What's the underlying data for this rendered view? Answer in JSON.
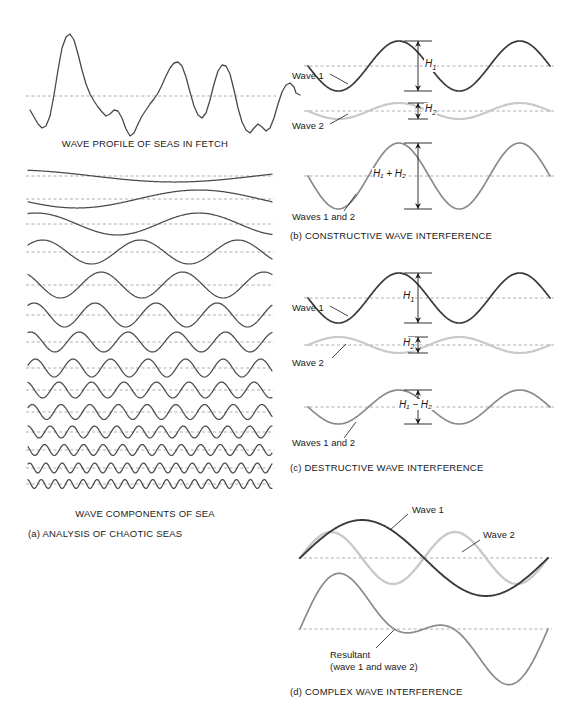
{
  "figure": {
    "background": "#ffffff",
    "colors": {
      "wave1": "#3a3a3a",
      "wave2": "#c9c9c9",
      "resultant": "#8a8a8a",
      "baseline": "#9a9a9a",
      "text": "#1a1a1a",
      "profile": "#4a4a4a"
    }
  },
  "panel_a": {
    "id": "a",
    "profile_caption": "WAVE PROFILE OF SEAS IN FETCH",
    "components_caption": "WAVE COMPONENTS OF SEA",
    "panel_caption": "(a) ANALYSIS OF CHAOTIC SEAS",
    "profile": {
      "baseline_y": 96,
      "points": [
        [
          30,
          110
        ],
        [
          34,
          117
        ],
        [
          38,
          124
        ],
        [
          42,
          128
        ],
        [
          46,
          126
        ],
        [
          50,
          116
        ],
        [
          54,
          95
        ],
        [
          58,
          70
        ],
        [
          62,
          48
        ],
        [
          66,
          37
        ],
        [
          70,
          34
        ],
        [
          74,
          40
        ],
        [
          78,
          54
        ],
        [
          82,
          70
        ],
        [
          86,
          84
        ],
        [
          90,
          94
        ],
        [
          94,
          101
        ],
        [
          98,
          107
        ],
        [
          102,
          112
        ],
        [
          106,
          116
        ],
        [
          110,
          114
        ],
        [
          114,
          110
        ],
        [
          118,
          111
        ],
        [
          122,
          118
        ],
        [
          126,
          129
        ],
        [
          130,
          136
        ],
        [
          134,
          133
        ],
        [
          138,
          124
        ],
        [
          142,
          116
        ],
        [
          146,
          110
        ],
        [
          150,
          104
        ],
        [
          154,
          99
        ],
        [
          158,
          93
        ],
        [
          162,
          85
        ],
        [
          166,
          76
        ],
        [
          170,
          68
        ],
        [
          174,
          63
        ],
        [
          178,
          62
        ],
        [
          182,
          66
        ],
        [
          186,
          77
        ],
        [
          190,
          92
        ],
        [
          194,
          106
        ],
        [
          198,
          115
        ],
        [
          202,
          118
        ],
        [
          206,
          113
        ],
        [
          210,
          100
        ],
        [
          214,
          84
        ],
        [
          218,
          71
        ],
        [
          222,
          65
        ],
        [
          226,
          66
        ],
        [
          230,
          74
        ],
        [
          234,
          90
        ],
        [
          238,
          108
        ],
        [
          242,
          122
        ],
        [
          246,
          130
        ],
        [
          250,
          133
        ],
        [
          254,
          128
        ],
        [
          258,
          124
        ],
        [
          262,
          127
        ],
        [
          266,
          131
        ],
        [
          270,
          128
        ],
        [
          274,
          118
        ],
        [
          278,
          104
        ],
        [
          282,
          92
        ],
        [
          286,
          85
        ],
        [
          290,
          83
        ],
        [
          294,
          87
        ],
        [
          296,
          93
        ]
      ],
      "points2": [
        [
          296,
          93
        ],
        [
          300,
          95
        ]
      ]
    },
    "components": [
      {
        "baseline_y": 176,
        "cycles": 0.75,
        "amplitude": 6,
        "phase": 0.3,
        "x0": 28,
        "x1": 272
      },
      {
        "baseline_y": 199,
        "cycles": 1.0,
        "amplitude": 9,
        "phase": 0.55,
        "x0": 28,
        "x1": 272
      },
      {
        "baseline_y": 224,
        "cycles": 1.5,
        "amplitude": 11,
        "phase": 0.2,
        "x0": 28,
        "x1": 272
      },
      {
        "baseline_y": 252,
        "cycles": 2.5,
        "amplitude": 12,
        "phase": 0.1,
        "x0": 28,
        "x1": 272
      },
      {
        "baseline_y": 285,
        "cycles": 3.0,
        "amplitude": 13,
        "phase": 0.35,
        "x0": 28,
        "x1": 272
      },
      {
        "baseline_y": 315,
        "cycles": 4.0,
        "amplitude": 12,
        "phase": 0.15,
        "x0": 28,
        "x1": 272
      },
      {
        "baseline_y": 342,
        "cycles": 5.0,
        "amplitude": 10,
        "phase": 0.2,
        "x0": 28,
        "x1": 272
      },
      {
        "baseline_y": 368,
        "cycles": 6.5,
        "amplitude": 9,
        "phase": 0.05,
        "x0": 28,
        "x1": 272
      },
      {
        "baseline_y": 390,
        "cycles": 7.5,
        "amplitude": 8,
        "phase": 0.3,
        "x0": 28,
        "x1": 272
      },
      {
        "baseline_y": 412,
        "cycles": 8.5,
        "amplitude": 7.5,
        "phase": 0.1,
        "x0": 28,
        "x1": 272
      },
      {
        "baseline_y": 432,
        "cycles": 11.0,
        "amplitude": 6,
        "phase": 0.25,
        "x0": 28,
        "x1": 272
      },
      {
        "baseline_y": 450,
        "cycles": 12.5,
        "amplitude": 5.5,
        "phase": 0.4,
        "x0": 28,
        "x1": 272
      },
      {
        "baseline_y": 468,
        "cycles": 15.0,
        "amplitude": 5,
        "phase": 0.15,
        "x0": 28,
        "x1": 272
      },
      {
        "baseline_y": 484,
        "cycles": 17.5,
        "amplitude": 4.5,
        "phase": 0.3,
        "x0": 28,
        "x1": 272
      }
    ]
  },
  "panel_b": {
    "id": "b",
    "caption": "(b) CONSTRUCTIVE WAVE INTERFERENCE",
    "labels": {
      "wave1": "Wave 1",
      "wave2": "Wave 2",
      "combined": "Waves 1 and 2"
    },
    "dimensions": {
      "h1": "H",
      "h1_sub": "1",
      "h2": "H",
      "h2_sub": "2",
      "sum_text": "H₁ + H₂"
    },
    "waves": {
      "wave1": {
        "baseline_y": 58,
        "cycles": 2.0,
        "amplitude": 25,
        "phase": 0.5,
        "x0": 18,
        "x1": 260
      },
      "wave2": {
        "baseline_y": 103,
        "cycles": 2.0,
        "amplitude": 8,
        "phase": 0.5,
        "x0": 18,
        "x1": 260
      },
      "resultant": {
        "baseline_y": 168,
        "cycles": 2.0,
        "amplitude": 33,
        "phase": 0.5,
        "x0": 18,
        "x1": 260
      }
    },
    "arrows": {
      "x": 128,
      "h1_top": 33,
      "h1_bot": 83,
      "h2_top": 95,
      "h2_bot": 111,
      "sum_top": 135,
      "sum_bot": 201
    }
  },
  "panel_c": {
    "id": "c",
    "caption": "(c) DESTRUCTIVE WAVE INTERFERENCE",
    "labels": {
      "wave1": "Wave 1",
      "wave2": "Wave 2",
      "combined": "Waves 1 and 2"
    },
    "dimensions": {
      "h1": "H",
      "h1_sub": "1",
      "h2": "H",
      "h2_sub": "2",
      "diff_text": "H₁ − H₂"
    },
    "waves": {
      "wave1": {
        "baseline_y": 46,
        "cycles": 2.0,
        "amplitude": 25,
        "phase": 0.5,
        "x0": 18,
        "x1": 260
      },
      "wave2": {
        "baseline_y": 93,
        "cycles": 2.0,
        "amplitude": 8,
        "phase": 0.0,
        "x0": 18,
        "x1": 260
      },
      "resultant": {
        "baseline_y": 155,
        "cycles": 2.0,
        "amplitude": 17,
        "phase": 0.5,
        "x0": 18,
        "x1": 260
      }
    },
    "arrows": {
      "x": 128,
      "h1_top": 21,
      "h1_bot": 71,
      "h2_top": 85,
      "h2_bot": 101,
      "diff_top": 138,
      "diff_bot": 172
    }
  },
  "panel_d": {
    "id": "d",
    "caption": "(d) COMPLEX WAVE INTERFERENCE",
    "labels": {
      "wave1": "Wave 1",
      "wave2": "Wave 2",
      "resultant_line1": "Resultant",
      "resultant_line2": "(wave 1 and wave 2)"
    },
    "waves": {
      "wave1": {
        "baseline_y": 62,
        "cycles": 1.0,
        "amplitude": 38,
        "phase": 0.0,
        "x0": 10,
        "x1": 258
      },
      "wave2": {
        "baseline_y": 62,
        "cycles": 2.0,
        "amplitude": 26,
        "phase": 0.0,
        "x0": 10,
        "x1": 258
      },
      "resultant": {
        "baseline_y": 133,
        "components": [
          {
            "cycles": 1.0,
            "amplitude": 38,
            "phase": 0.0
          },
          {
            "cycles": 2.0,
            "amplitude": 26,
            "phase": 0.0
          }
        ],
        "x0": 10,
        "x1": 258
      }
    }
  }
}
